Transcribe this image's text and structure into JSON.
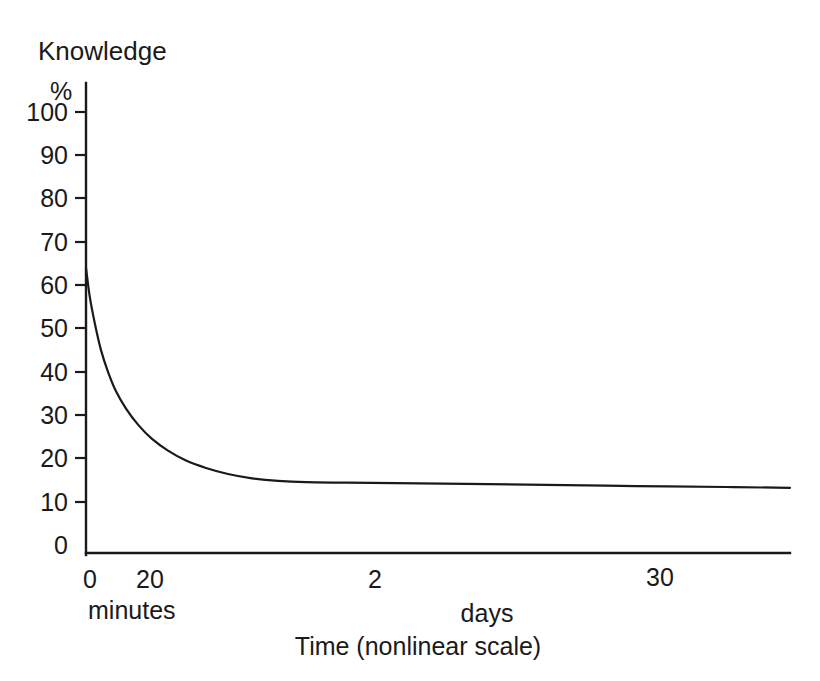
{
  "chart_data": {
    "type": "line",
    "title": "Knowledge",
    "subtitle": "",
    "xlabel": "Time (nonlinear scale)",
    "ylabel": "Knowledge",
    "yunit": "%",
    "ylim": [
      0,
      100
    ],
    "grid": false,
    "legend": "none",
    "y_ticks": [
      0,
      10,
      20,
      30,
      40,
      50,
      60,
      70,
      80,
      90,
      100
    ],
    "y_tick_labels": [
      "0",
      "10",
      "20",
      "30",
      "40",
      "50",
      "60",
      "70",
      "80",
      "90",
      "100"
    ],
    "x_tick_labels": [
      "0",
      "20",
      "2",
      "30"
    ],
    "x_group_labels": [
      "minutes",
      "days"
    ],
    "x_axis_note": "nonlinear scale",
    "series": [
      {
        "name": "Retention (forgetting curve)",
        "points": [
          {
            "x_px": 0,
            "y": 64
          },
          {
            "x_px": 4,
            "y": 57
          },
          {
            "x_px": 9,
            "y": 51
          },
          {
            "x_px": 15,
            "y": 45
          },
          {
            "x_px": 22,
            "y": 40
          },
          {
            "x_px": 30,
            "y": 35.5
          },
          {
            "x_px": 40,
            "y": 31.5
          },
          {
            "x_px": 52,
            "y": 27.8
          },
          {
            "x_px": 66,
            "y": 24.5
          },
          {
            "x_px": 82,
            "y": 21.8
          },
          {
            "x_px": 100,
            "y": 19.5
          },
          {
            "x_px": 120,
            "y": 17.8
          },
          {
            "x_px": 142,
            "y": 16.4
          },
          {
            "x_px": 166,
            "y": 15.4
          },
          {
            "x_px": 192,
            "y": 14.8
          },
          {
            "x_px": 220,
            "y": 14.5
          },
          {
            "x_px": 260,
            "y": 14.4
          },
          {
            "x_px": 310,
            "y": 14.3
          },
          {
            "x_px": 380,
            "y": 14.1
          },
          {
            "x_px": 460,
            "y": 13.9
          },
          {
            "x_px": 550,
            "y": 13.6
          },
          {
            "x_px": 640,
            "y": 13.4
          },
          {
            "x_px": 704,
            "y": 13.2
          }
        ]
      }
    ]
  },
  "labels": {
    "title": "Knowledge",
    "percent_symbol": "%",
    "axis_title": "Time (nonlinear scale)",
    "minutes": "minutes",
    "days": "days"
  },
  "y_axis": {
    "t100": "100",
    "t90": "90",
    "t80": "80",
    "t70": "70",
    "t60": "60",
    "t50": "50",
    "t40": "40",
    "t30": "30",
    "t20": "20",
    "t10": "10",
    "t0": "0"
  },
  "x_axis": {
    "t0": "0",
    "t20": "20",
    "t2": "2",
    "t30": "30"
  },
  "colors": {
    "ink": "#1a1a1a",
    "background": "#ffffff"
  }
}
